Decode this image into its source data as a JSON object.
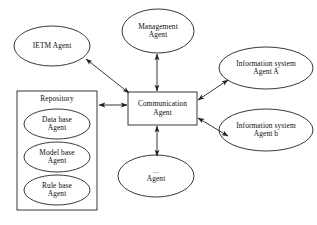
{
  "diagram": {
    "background_color": "#ffffff",
    "stroke_color": "#222222",
    "text_color": "#0d0d0d",
    "nodes": {
      "ietm_agent": {
        "shape": "ellipse",
        "label": "IETM Agent"
      },
      "management_agent": {
        "shape": "ellipse",
        "line1": "Management",
        "line2": "Agent"
      },
      "communication_agent": {
        "shape": "rectangle",
        "line1": "Communication",
        "line2": "Agent"
      },
      "information_system_agent_a": {
        "shape": "ellipse",
        "line1": "Information system",
        "line2": "Agent A"
      },
      "information_system_agent_b": {
        "shape": "ellipse",
        "line1": "Information system",
        "line2": "Agent b"
      },
      "ellipsis_agent": {
        "shape": "ellipse",
        "line1": "…",
        "line2": "Agent"
      },
      "repository": {
        "shape": "rectangle",
        "label": "Repository"
      },
      "data_base_agent": {
        "shape": "ellipse",
        "line1": "Data base",
        "line2": "Agent"
      },
      "model_base_agent": {
        "shape": "ellipse",
        "line1": "Model base",
        "line2": "Agent"
      },
      "rule_base_agent": {
        "shape": "ellipse",
        "line1": "Rule base",
        "line2": "Agent"
      }
    },
    "connections": [
      {
        "from": "communication_agent",
        "to": "ietm_agent",
        "arrow": "double",
        "orientation": "diagonal"
      },
      {
        "from": "communication_agent",
        "to": "management_agent",
        "arrow": "double",
        "orientation": "vertical"
      },
      {
        "from": "communication_agent",
        "to": "information_system_agent_a",
        "arrow": "double",
        "orientation": "diagonal"
      },
      {
        "from": "communication_agent",
        "to": "information_system_agent_b",
        "arrow": "double",
        "orientation": "diagonal"
      },
      {
        "from": "communication_agent",
        "to": "ellipsis_agent",
        "arrow": "double",
        "orientation": "vertical"
      },
      {
        "from": "communication_agent",
        "to": "repository",
        "arrow": "double",
        "orientation": "horizontal"
      }
    ]
  }
}
